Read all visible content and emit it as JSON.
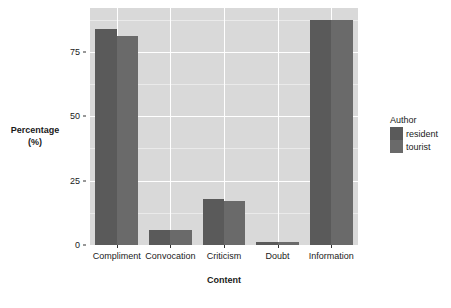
{
  "chart_data": {
    "type": "bar",
    "title": "",
    "subtitle": "",
    "xlabel": "Content",
    "ylabel": "Percentage\n(%)",
    "ylabel_lines": [
      "Percentage",
      "(%)"
    ],
    "categories": [
      "Compliment",
      "Convocation",
      "Criticism",
      "Doubt",
      "Information"
    ],
    "series": [
      {
        "name": "resident",
        "values": [
          84,
          6,
          18,
          1,
          87.5
        ],
        "color": "#5a5a5a"
      },
      {
        "name": "tourist",
        "values": [
          81,
          6,
          17,
          1,
          87.5
        ],
        "color": "#6a6a6a"
      }
    ],
    "ylim": [
      0,
      92
    ],
    "yticks": [
      0,
      25,
      50,
      75
    ],
    "ytick_labels": [
      "0",
      "25",
      "50",
      "75"
    ],
    "grid": true,
    "grid_minor": true,
    "legend": {
      "title": "Author",
      "position": "right",
      "entries": [
        "resident",
        "tourist"
      ]
    },
    "panel_background": "#d9d9d9",
    "grid_color": "#ffffff",
    "plot_background": "#ffffff"
  }
}
